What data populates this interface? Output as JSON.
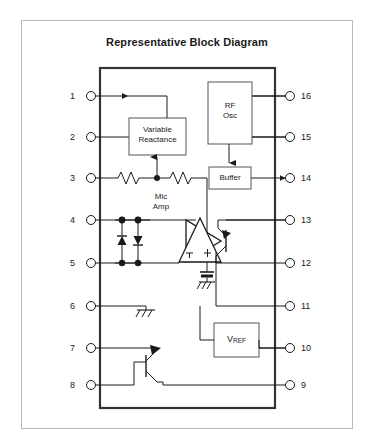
{
  "page": {
    "title": "Representative Block Diagram",
    "background_color": "#ffffff",
    "frame_color": "#b9b9b9",
    "line_color": "#1a1a1a",
    "chip_outline_color": "#333333"
  },
  "blocks": [
    {
      "id": "variable-reactance",
      "label_line1": "Variable",
      "label_line2": "Reactance"
    },
    {
      "id": "rf-osc",
      "label_line1": "RF",
      "label_line2": "Osc"
    },
    {
      "id": "buffer",
      "label_line1": "Buffer",
      "label_line2": ""
    },
    {
      "id": "mic-amp",
      "label_line1": "Mic",
      "label_line2": "Amp"
    },
    {
      "id": "vref",
      "label_main": "V",
      "label_sub": "REF"
    }
  ],
  "pins": {
    "left": [
      {
        "number": "1",
        "y": 96
      },
      {
        "number": "2",
        "y": 137
      },
      {
        "number": "3",
        "y": 178
      },
      {
        "number": "4",
        "y": 220
      },
      {
        "number": "5",
        "y": 263
      },
      {
        "number": "6",
        "y": 306
      },
      {
        "number": "7",
        "y": 348
      },
      {
        "number": "8",
        "y": 385
      }
    ],
    "right": [
      {
        "number": "16",
        "y": 96
      },
      {
        "number": "15",
        "y": 137
      },
      {
        "number": "14",
        "y": 178
      },
      {
        "number": "13",
        "y": 220
      },
      {
        "number": "12",
        "y": 263
      },
      {
        "number": "11",
        "y": 306
      },
      {
        "number": "10",
        "y": 348
      },
      {
        "number": "9",
        "y": 385
      }
    ]
  },
  "components": {
    "resistors": 2,
    "diodes": 2,
    "transistors": 2,
    "grounds": 3,
    "opamp_minus": "–",
    "opamp_plus": "+"
  }
}
